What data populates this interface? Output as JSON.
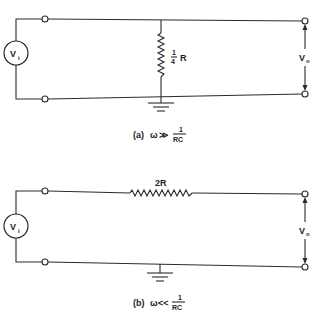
{
  "header": {
    "faint_text": ""
  },
  "circuit_a": {
    "source_label": "V",
    "source_sub": "i",
    "resistor_numerator": "1",
    "resistor_denominator": "4",
    "resistor_label": "R",
    "output_label": "V",
    "output_sub": "o",
    "caption_prefix": "(a)",
    "caption_omega": "ω",
    "caption_relation": "≫",
    "caption_num": "1",
    "caption_den": "RC"
  },
  "circuit_b": {
    "source_label": "V",
    "source_sub": "i",
    "resistor_label": "2R",
    "output_label": "V",
    "output_sub": "o",
    "caption_prefix": "(b)",
    "caption_omega": "ω",
    "caption_relation": "<<",
    "caption_num": "1",
    "caption_den": "RC"
  },
  "colors": {
    "ink": "#2a2a2a",
    "background": "#ffffff"
  }
}
